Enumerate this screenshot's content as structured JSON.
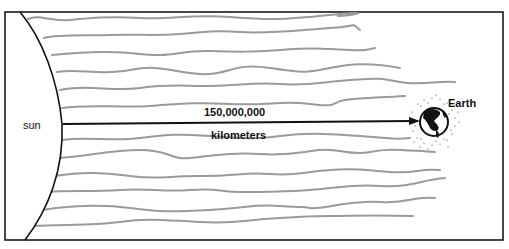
{
  "diagram": {
    "sun_label": "sun",
    "earth_label": "Earth",
    "distance_value": "150,000,000",
    "distance_unit": "kilometers",
    "colors": {
      "border": "#1a1a1a",
      "rays": "#9a9a9a",
      "arrow": "#111111",
      "earth": "#111111"
    }
  }
}
